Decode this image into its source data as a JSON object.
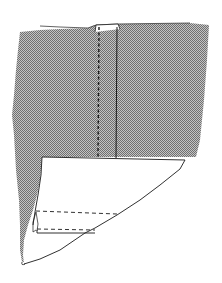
{
  "diagram": {
    "colors": {
      "background": "#ffffff",
      "fabric_pattern_light": "#bdbdbd",
      "fabric_pattern_dark": "#6e6e6e",
      "line": "#1a1a1a",
      "fold_panel": "#ffffff"
    },
    "elements": [
      {
        "name": "fabric-panel",
        "description": "gray stippled fabric (right side)"
      },
      {
        "name": "center-seam-stitch",
        "style": "dashed",
        "description": "vertical stitching line"
      },
      {
        "name": "seam-edge",
        "style": "solid",
        "description": "vertical seam fold line"
      },
      {
        "name": "folded-hem",
        "description": "white folded-back hem/facing"
      },
      {
        "name": "hem-stitch-upper",
        "style": "dashed"
      },
      {
        "name": "hem-stitch-lower",
        "style": "dashed"
      }
    ]
  }
}
